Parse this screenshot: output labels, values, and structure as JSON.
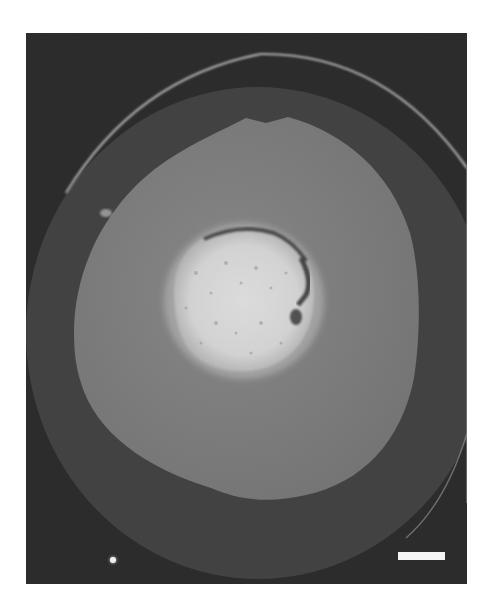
{
  "figure": {
    "colors": {
      "background": "#1b1b1b",
      "outer_disk": "#3a3a3a",
      "outer_rim": "#bdbdbd",
      "middle_zone": "#7c7c7c",
      "core": "#e8e8e8",
      "core_crack": "#2a2a2a",
      "scale_bar": "#f4f4f4"
    },
    "scale_bar": {
      "label": ""
    },
    "caption_fragment": ""
  }
}
